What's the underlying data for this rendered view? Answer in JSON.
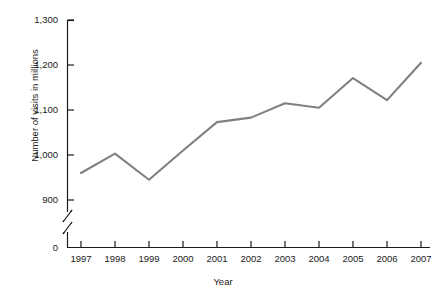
{
  "chart_data": {
    "type": "line",
    "title": "",
    "xlabel": "Year",
    "ylabel": "Number of visits in millions",
    "categories": [
      "1997",
      "1998",
      "1999",
      "2000",
      "2001",
      "2002",
      "2003",
      "2004",
      "2005",
      "2006",
      "2007"
    ],
    "values": [
      960,
      1003,
      945,
      1010,
      1073,
      1083,
      1115,
      1105,
      1171,
      1122,
      1205
    ],
    "series": [
      {
        "name": "Number of visits",
        "values": [
          960,
          1003,
          945,
          1010,
          1073,
          1083,
          1115,
          1105,
          1171,
          1122,
          1205
        ]
      }
    ],
    "ylim": [
      900,
      1300
    ],
    "y_ticks": [
      "1,300",
      "1,200",
      "1,100",
      "1,000",
      "900",
      "0"
    ],
    "y_tick_values": [
      1300,
      1200,
      1100,
      1000,
      900,
      0
    ],
    "axis_break": true,
    "axis_break_note": "y-axis broken between 0 and 900",
    "grid": false,
    "legend": false,
    "legend_position": "none",
    "line_color": "#808080",
    "axis_color": "#1a1a1a",
    "background_color": "#ffffff"
  },
  "axes": {
    "y_title": "Number of visits in millions",
    "x_title": "Year",
    "y_tick_labels": [
      "1,300",
      "1,200",
      "1,100",
      "1,000",
      "900",
      "0"
    ],
    "x_tick_labels": [
      "1997",
      "1998",
      "1999",
      "2000",
      "2001",
      "2002",
      "2003",
      "2004",
      "2005",
      "2006",
      "2007"
    ]
  },
  "artifacts": {
    "cropped_title_remnant": ""
  }
}
